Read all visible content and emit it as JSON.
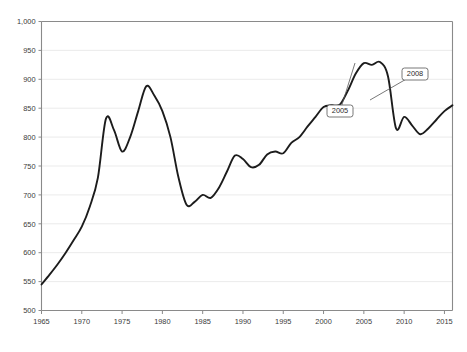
{
  "chart_data": {
    "type": "line",
    "title": "",
    "xlabel": "",
    "ylabel": "",
    "xlim": [
      1965,
      2016
    ],
    "ylim": [
      500,
      1000
    ],
    "grid": true,
    "legend": false,
    "accent_color": "#1c1c1c",
    "grid_color": "#e9e9e9",
    "axis_color": "#8a8a8a",
    "ytick_labels": [
      "1,000",
      "950",
      "900",
      "850",
      "800",
      "750",
      "700",
      "650",
      "600",
      "550",
      "500"
    ],
    "ytick_values": [
      1000,
      950,
      900,
      850,
      800,
      750,
      700,
      650,
      600,
      550,
      500
    ],
    "xtick_labels": [
      "1965",
      "1970",
      "1975",
      "1980",
      "1985",
      "1990",
      "1995",
      "2000",
      "2005",
      "2010",
      "2015"
    ],
    "xtick_values": [
      1965,
      1970,
      1975,
      1980,
      1985,
      1990,
      1995,
      2000,
      2005,
      2010,
      2015
    ],
    "x": [
      1965,
      1966,
      1967,
      1968,
      1969,
      1970,
      1971,
      1972,
      1973,
      1974,
      1975,
      1976,
      1977,
      1978,
      1979,
      1980,
      1981,
      1982,
      1983,
      1984,
      1985,
      1986,
      1987,
      1988,
      1989,
      1990,
      1991,
      1992,
      1993,
      1994,
      1995,
      1996,
      1997,
      1998,
      1999,
      2000,
      2001,
      2002,
      2003,
      2004,
      2005,
      2006,
      2007,
      2008,
      2009,
      2010,
      2011,
      2012,
      2013,
      2014,
      2015,
      2016
    ],
    "values": [
      545,
      562,
      580,
      600,
      622,
      645,
      680,
      730,
      832,
      812,
      775,
      800,
      845,
      888,
      872,
      845,
      800,
      730,
      683,
      688,
      700,
      695,
      712,
      740,
      768,
      762,
      748,
      752,
      770,
      775,
      772,
      790,
      800,
      818,
      835,
      852,
      855,
      856,
      880,
      910,
      928,
      925,
      930,
      905,
      815,
      835,
      820,
      805,
      815,
      830,
      845,
      855
    ],
    "series": [
      {
        "name": "series-1",
        "values": [
          545,
          562,
          580,
          600,
          622,
          645,
          680,
          730,
          832,
          812,
          775,
          800,
          845,
          888,
          872,
          845,
          800,
          730,
          683,
          688,
          700,
          695,
          712,
          740,
          768,
          762,
          748,
          752,
          770,
          775,
          772,
          790,
          800,
          818,
          835,
          852,
          855,
          856,
          880,
          910,
          928,
          925,
          930,
          905,
          815,
          835,
          820,
          805,
          815,
          830,
          845,
          855
        ]
      }
    ],
    "annotations": [
      {
        "label": "2005",
        "x": 2005,
        "y": 928,
        "box_x": 340,
        "box_y": 111,
        "anchor_x": 355,
        "anchor_y": 63
      },
      {
        "label": "2008",
        "x": 2008,
        "y": 905,
        "box_x": 415,
        "box_y": 74,
        "anchor_x": 370,
        "anchor_y": 100
      }
    ]
  }
}
